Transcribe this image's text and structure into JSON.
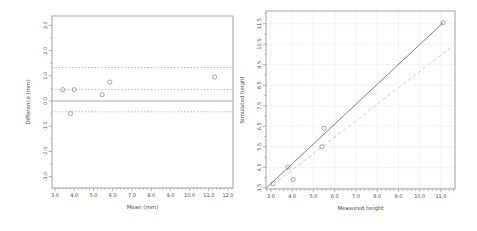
{
  "figure": {
    "background": "#ffffff",
    "axis_color": "#8c8c8c",
    "text_color": "#4a4a4a"
  },
  "chart_data": [
    {
      "id": "bland-altman",
      "type": "scatter",
      "title": "",
      "xlabel": "Mean (mm)",
      "ylabel": "Difference (mm)",
      "xlim": [
        2.84,
        12.26
      ],
      "ylim": [
        -3.45,
        3.37
      ],
      "xticks": [
        "3.0",
        "4.0",
        "5.0",
        "6.0",
        "7.0",
        "8.0",
        "9.0",
        "10.0",
        "11.0",
        "12.0"
      ],
      "yticks": [
        "-3.0",
        "-2.0",
        "-1.0",
        "0.0",
        "1.0",
        "2.0",
        "3.0"
      ],
      "minor_x_step": 0.2,
      "minor_y_step": 0.5,
      "grid": false,
      "grid_color": "",
      "point_color": "#8f8f8f",
      "points": [
        [
          3.4,
          0.45
        ],
        [
          3.8,
          -0.5
        ],
        [
          4.0,
          0.45
        ],
        [
          5.45,
          0.25
        ],
        [
          5.85,
          0.75
        ],
        [
          11.3,
          0.95
        ]
      ],
      "hlines": [
        {
          "name": "zero-line",
          "y": 0.0,
          "dash": "solid",
          "color": "#979797"
        },
        {
          "name": "mean-difference-line",
          "y": 0.45,
          "dash": "dotted",
          "color": "#9a9a9a"
        },
        {
          "name": "upper-limit-line",
          "y": 1.33,
          "dash": "dotted",
          "color": "#9a9a9a"
        },
        {
          "name": "lower-limit-line",
          "y": -0.43,
          "dash": "dotted",
          "color": "#9a9a9a"
        }
      ],
      "lines": []
    },
    {
      "id": "simulated-vs-measured",
      "type": "scatter",
      "title": "",
      "xlabel": "Measured height",
      "ylabel": "Simulated height",
      "xlim": [
        2.77,
        11.66
      ],
      "ylim": [
        3.44,
        12.12
      ],
      "xticks": [
        "3.0",
        "4.0",
        "5.0",
        "6.0",
        "7.0",
        "8.0",
        "9.0",
        "10.0",
        "11.0"
      ],
      "yticks": [
        "3.5",
        "4.5",
        "5.5",
        "6.5",
        "7.5",
        "8.5",
        "9.5",
        "10.5",
        "11.5"
      ],
      "minor_x_step": 0.2,
      "minor_y_step": 0.5,
      "grid": true,
      "grid_color": "#f1ebeb",
      "point_color": "#8f8f8f",
      "points": [
        [
          3.1,
          3.7
        ],
        [
          3.8,
          4.5
        ],
        [
          4.05,
          3.9
        ],
        [
          5.4,
          5.5
        ],
        [
          5.5,
          6.4
        ],
        [
          11.1,
          11.55
        ]
      ],
      "hlines": [],
      "lines": [
        {
          "name": "regression-line",
          "x1": 2.8,
          "y1": 3.5,
          "x2": 11.1,
          "y2": 11.55,
          "dash": "solid",
          "color": "#6e6e6e"
        },
        {
          "name": "reference-dashed-line",
          "x1": 3.35,
          "y1": 3.85,
          "x2": 11.6,
          "y2": 10.45,
          "dash": "dashed",
          "color": "#c4c4c4"
        }
      ]
    }
  ]
}
